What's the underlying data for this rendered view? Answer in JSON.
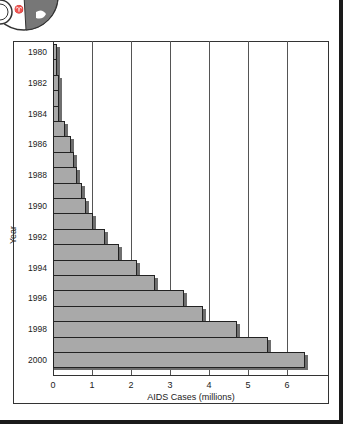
{
  "chart_data": {
    "type": "bar",
    "orientation": "horizontal",
    "title": "",
    "xlabel": "AIDS Cases (millions)",
    "ylabel": "Year",
    "xlim": [
      0,
      7
    ],
    "x_ticks": [
      "0",
      "1",
      "2",
      "3",
      "4",
      "5",
      "6"
    ],
    "y_tick_labels": [
      "1980",
      "1982",
      "1984",
      "1986",
      "1988",
      "1990",
      "1992",
      "1994",
      "1996",
      "1998",
      "2000"
    ],
    "grid": "vertical",
    "categories": [
      "1980",
      "1981",
      "1982",
      "1983",
      "1984",
      "1985",
      "1986",
      "1987",
      "1988",
      "1989",
      "1990",
      "1991",
      "1992",
      "1993",
      "1994",
      "1995",
      "1996",
      "1997",
      "1998",
      "1999",
      "2000"
    ],
    "values": [
      0.05,
      0.05,
      0.12,
      0.12,
      0.12,
      0.28,
      0.44,
      0.51,
      0.59,
      0.72,
      0.82,
      0.99,
      1.31,
      1.67,
      2.13,
      2.59,
      3.33,
      3.82,
      4.69,
      5.49,
      6.44
    ],
    "bar_color": "#a9a9a9",
    "shadow_color": "#6e6e6e"
  },
  "decoration": {
    "icon": "globe-icon"
  }
}
